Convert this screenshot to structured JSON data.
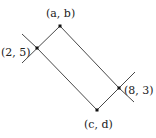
{
  "diagram": {
    "points": [
      {
        "id": "ab",
        "label": "(a, b)",
        "x": 60,
        "y": 26
      },
      {
        "id": "p25",
        "label": "(2, 5)",
        "x": 37,
        "y": 48
      },
      {
        "id": "p83",
        "label": "(8, 3)",
        "x": 119,
        "y": 88
      },
      {
        "id": "cd",
        "label": "(c, d)",
        "x": 97,
        "y": 110
      }
    ],
    "colors": {
      "line": "#333333",
      "point": "#111111",
      "text": "#222222"
    }
  }
}
